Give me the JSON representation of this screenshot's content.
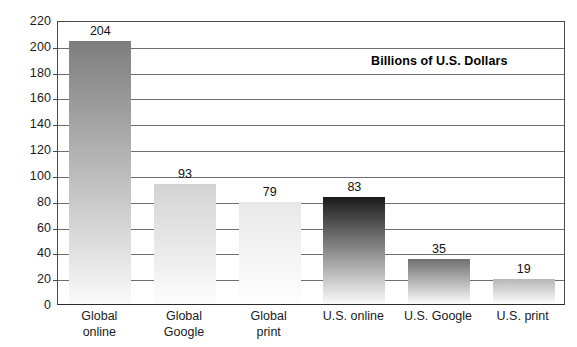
{
  "chart_data": {
    "type": "bar",
    "title": "",
    "subtitle": "",
    "annotation": "Billions of U.S. Dollars",
    "xlabel": "",
    "ylabel": "",
    "ylim": [
      0,
      220
    ],
    "ytick_step": 20,
    "yticks": [
      "220",
      "200",
      "180",
      "160",
      "140",
      "120",
      "100",
      "80",
      "60",
      "40",
      "20",
      "0"
    ],
    "grid": true,
    "legend": false,
    "categories": [
      "Global\nonline",
      "Global\nGoogle",
      "Global\nprint",
      "U.S. online",
      "U.S. Google",
      "U.S. print"
    ],
    "values": [
      204,
      93,
      79,
      83,
      35,
      19
    ],
    "value_labels": [
      "204",
      "93",
      "79",
      "83",
      "35",
      "19"
    ],
    "bar_colors_top": [
      "#7d7d7d",
      "#d3d3d3",
      "#e8e8e8",
      "#1a1a1a",
      "#6f6f6f",
      "#b7b7b7"
    ],
    "bar_colors_bottom": [
      "#fafafa",
      "#fdfdfd",
      "#fefefe",
      "#fbfbfb",
      "#fcfcfc",
      "#fdfdfd"
    ]
  },
  "axis": {
    "frame_color": "#4a4a4a",
    "gridline_color": "#6e6e6e",
    "baseline_color": "#2b2b2b"
  }
}
